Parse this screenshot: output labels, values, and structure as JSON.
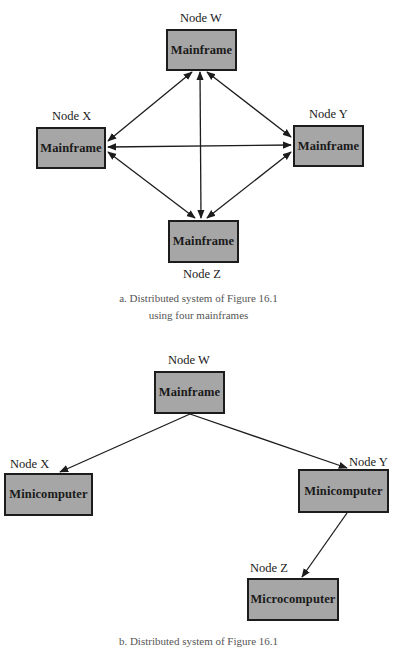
{
  "figure_a": {
    "caption_line1": "a. Distributed system of Figure 16.1",
    "caption_line2": "using four mainframes",
    "nodes": {
      "W": {
        "label": "Node W",
        "type": "Mainframe"
      },
      "X": {
        "label": "Node X",
        "type": "Mainframe"
      },
      "Y": {
        "label": "Node Y",
        "type": "Mainframe"
      },
      "Z": {
        "label": "Node Z",
        "type": "Mainframe"
      }
    },
    "edges": [
      {
        "from": "W",
        "to": "X",
        "direction": "bidirectional"
      },
      {
        "from": "W",
        "to": "Y",
        "direction": "bidirectional"
      },
      {
        "from": "W",
        "to": "Z",
        "direction": "bidirectional"
      },
      {
        "from": "X",
        "to": "Y",
        "direction": "bidirectional"
      },
      {
        "from": "X",
        "to": "Z",
        "direction": "bidirectional"
      },
      {
        "from": "Y",
        "to": "Z",
        "direction": "bidirectional"
      }
    ]
  },
  "figure_b": {
    "caption_line1": "b. Distributed system of Figure 16.1",
    "nodes": {
      "W": {
        "label": "Node W",
        "type": "Mainframe"
      },
      "X": {
        "label": "Node X",
        "type": "Minicomputer"
      },
      "Y": {
        "label": "Node Y",
        "type": "Minicomputer"
      },
      "Z": {
        "label": "Node Z",
        "type": "Microcomputer"
      }
    },
    "edges": [
      {
        "from": "W",
        "to": "X",
        "direction": "directed"
      },
      {
        "from": "W",
        "to": "Y",
        "direction": "directed"
      },
      {
        "from": "Y",
        "to": "Z",
        "direction": "directed"
      }
    ]
  },
  "colors": {
    "box_fill": "#a6a6a6",
    "box_border": "#1c1c1c",
    "line": "#1c1c1c"
  }
}
